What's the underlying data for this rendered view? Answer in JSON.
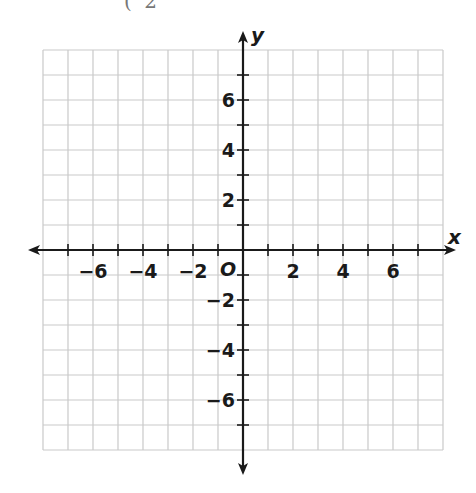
{
  "header": {
    "cropped_text": "( 2"
  },
  "chart_data": {
    "type": "coordinate-grid",
    "title": "",
    "xlabel": "x",
    "ylabel": "y",
    "origin_label": "O",
    "xlim": [
      -8,
      8
    ],
    "ylim": [
      -8,
      8
    ],
    "grid": true,
    "grid_step": 1,
    "tick_step": 1,
    "x_tick_labels": [
      {
        "value": -6,
        "label": "−6"
      },
      {
        "value": -4,
        "label": "−4"
      },
      {
        "value": -2,
        "label": "−2"
      },
      {
        "value": 2,
        "label": "2"
      },
      {
        "value": 4,
        "label": "4"
      },
      {
        "value": 6,
        "label": "6"
      }
    ],
    "y_tick_labels": [
      {
        "value": 6,
        "label": "6"
      },
      {
        "value": 4,
        "label": "4"
      },
      {
        "value": 2,
        "label": "2"
      },
      {
        "value": -2,
        "label": "−2"
      },
      {
        "value": -4,
        "label": "−4"
      },
      {
        "value": -6,
        "label": "−6"
      }
    ],
    "series": [],
    "legend": null
  },
  "style": {
    "grid_color": "#c9c9c9",
    "axis_color": "#1a1a1a",
    "label_color": "#1a1a1a"
  }
}
